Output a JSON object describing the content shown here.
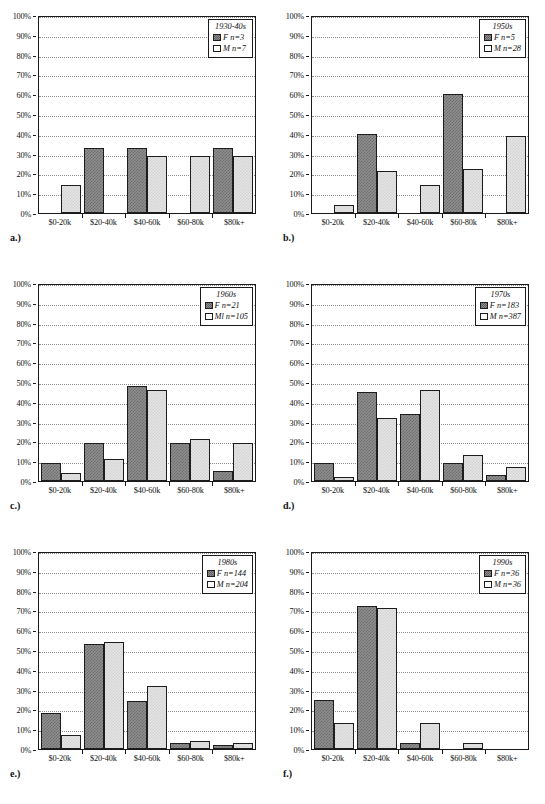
{
  "figure": {
    "panel_count": 6,
    "y_ticks": [
      "0%",
      "10%",
      "20%",
      "30%",
      "40%",
      "50%",
      "60%",
      "70%",
      "80%",
      "90%",
      "100%"
    ],
    "categories": [
      "$0-20k",
      "$20-40k",
      "$40-60k",
      "$60-80k",
      "$80k+"
    ]
  },
  "chart_data": [
    {
      "type": "bar",
      "panel_label": "a.)",
      "title": "1930-40s",
      "categories": [
        "$0-20k",
        "$20-40k",
        "$40-60k",
        "$60-80k",
        "$80k+"
      ],
      "series": [
        {
          "name": "F n=3",
          "legend_key": "F",
          "n": 3,
          "values": [
            0,
            33,
            33,
            0,
            33
          ]
        },
        {
          "name": "M n=7",
          "legend_key": "M",
          "n": 7,
          "values": [
            14,
            0,
            29,
            29,
            29
          ]
        }
      ],
      "xlabel": "",
      "ylabel": "",
      "ylim": [
        0,
        100
      ],
      "grid": true,
      "legend_position": "top-right"
    },
    {
      "type": "bar",
      "panel_label": "b.)",
      "title": "1950s",
      "categories": [
        "$0-20k",
        "$20-40k",
        "$40-60k",
        "$60-80k",
        "$80k+"
      ],
      "series": [
        {
          "name": "F n=5",
          "legend_key": "F",
          "n": 5,
          "values": [
            0,
            40,
            0,
            60,
            0
          ]
        },
        {
          "name": "M n=28",
          "legend_key": "M",
          "n": 28,
          "values": [
            4,
            21,
            14,
            22,
            39
          ]
        }
      ],
      "xlabel": "",
      "ylabel": "",
      "ylim": [
        0,
        100
      ],
      "grid": true,
      "legend_position": "top-right"
    },
    {
      "type": "bar",
      "panel_label": "c.)",
      "title": "1960s",
      "categories": [
        "$0-20k",
        "$20-40k",
        "$40-60k",
        "$60-80k",
        "$80k+"
      ],
      "series": [
        {
          "name": "F n=21",
          "legend_key": "F",
          "n": 21,
          "values": [
            9,
            19,
            48,
            19,
            5
          ]
        },
        {
          "name": "Ml n=105",
          "legend_key": "M",
          "n": 105,
          "values": [
            4,
            11,
            46,
            21,
            19
          ]
        }
      ],
      "xlabel": "",
      "ylabel": "",
      "ylim": [
        0,
        100
      ],
      "grid": true,
      "legend_position": "top-right"
    },
    {
      "type": "bar",
      "panel_label": "d.)",
      "title": "1970s",
      "categories": [
        "$0-20k",
        "$20-40k",
        "$40-60k",
        "$60-80k",
        "$80k+"
      ],
      "series": [
        {
          "name": "F n=183",
          "legend_key": "F",
          "n": 183,
          "values": [
            9,
            45,
            34,
            9,
            3
          ]
        },
        {
          "name": "M n=387",
          "legend_key": "M",
          "n": 387,
          "values": [
            2,
            32,
            46,
            13,
            7
          ]
        }
      ],
      "xlabel": "",
      "ylabel": "",
      "ylim": [
        0,
        100
      ],
      "grid": true,
      "legend_position": "top-right"
    },
    {
      "type": "bar",
      "panel_label": "e.)",
      "title": "1980s",
      "categories": [
        "$0-20k",
        "$20-40k",
        "$40-60k",
        "$60-80k",
        "$80k+"
      ],
      "series": [
        {
          "name": "F n=144",
          "legend_key": "F",
          "n": 144,
          "values": [
            18,
            53,
            24,
            3,
            2
          ]
        },
        {
          "name": "M n=204",
          "legend_key": "M",
          "n": 204,
          "values": [
            7,
            54,
            32,
            4,
            3
          ]
        }
      ],
      "xlabel": "",
      "ylabel": "",
      "ylim": [
        0,
        100
      ],
      "grid": true,
      "legend_position": "top-right"
    },
    {
      "type": "bar",
      "panel_label": "f.)",
      "title": "1990s",
      "categories": [
        "$0-20k",
        "$20-40k",
        "$40-60k",
        "$60-80k",
        "$80k+"
      ],
      "series": [
        {
          "name": "F n=36",
          "legend_key": "F",
          "n": 36,
          "values": [
            25,
            72,
            3,
            0,
            0
          ]
        },
        {
          "name": "M n=36",
          "legend_key": "M",
          "n": 36,
          "values": [
            13,
            71,
            13,
            3,
            0
          ]
        }
      ],
      "xlabel": "",
      "ylabel": "",
      "ylim": [
        0,
        100
      ],
      "grid": true,
      "legend_position": "top-right"
    }
  ]
}
